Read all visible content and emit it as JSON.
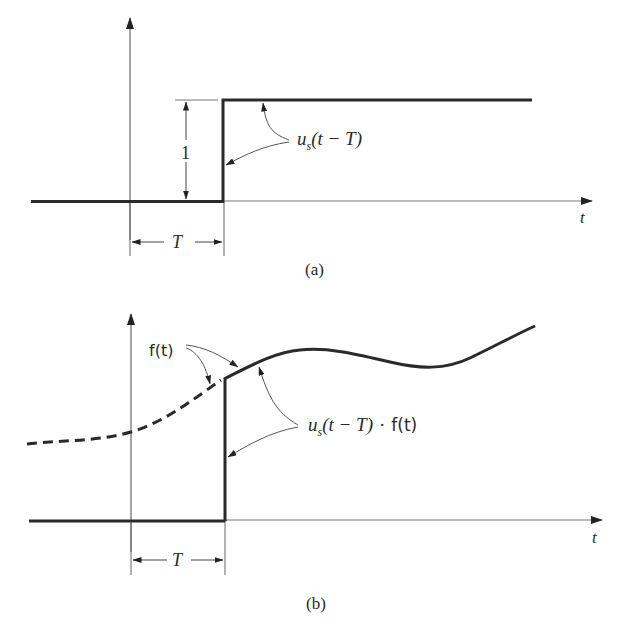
{
  "figure": {
    "panel_a": {
      "caption": "(a)",
      "time_axis_label": "t",
      "amplitude_label": "1",
      "delay_label": "T",
      "function_label": {
        "main": "u",
        "subscript": "s",
        "argument": "(t − T)"
      }
    },
    "panel_b": {
      "caption": "(b)",
      "time_axis_label": "t",
      "delay_label": "T",
      "signal_label": "f(t)",
      "product_label": {
        "main": "u",
        "subscript": "s",
        "argument": "(t − T)",
        "operator": "·",
        "factor": "f(t)"
      }
    }
  },
  "colors": {
    "ink": "#2a2a2a",
    "axis": "#555555",
    "background": "#ffffff"
  }
}
